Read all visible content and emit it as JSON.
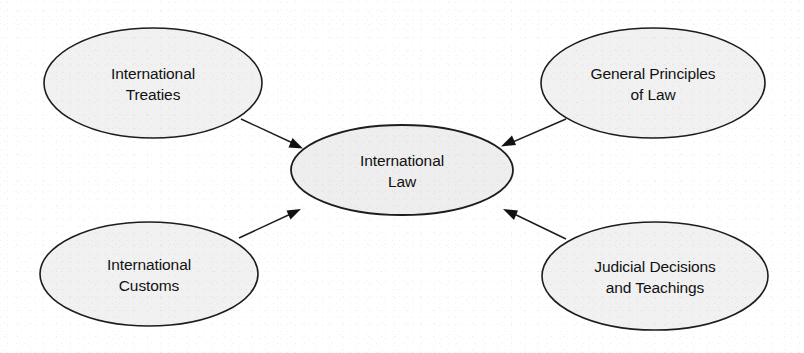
{
  "diagram": {
    "type": "hub-and-spoke concept map",
    "background_color": "#ffffff",
    "node_fill_color": "#f1f1f1",
    "node_stroke_color": "#1d1d1d",
    "arrow_color": "#111111",
    "center_node": {
      "id": "international-law",
      "label": "International\nLaw",
      "cx": 402,
      "cy": 170,
      "rx": 111,
      "ry": 45
    },
    "source_nodes": [
      {
        "id": "international-treaties",
        "label": "International\nTreaties",
        "cx": 153,
        "cy": 83,
        "rx": 109,
        "ry": 55,
        "position": "top-left"
      },
      {
        "id": "general-principles-of-law",
        "label": "General Principles\nof Law",
        "cx": 653,
        "cy": 83,
        "rx": 112,
        "ry": 55,
        "position": "top-right"
      },
      {
        "id": "international-customs",
        "label": "International\nCustoms",
        "cx": 149,
        "cy": 274,
        "rx": 109,
        "ry": 52,
        "position": "bottom-left"
      },
      {
        "id": "judicial-decisions-and-teachings",
        "label": "Judicial Decisions\nand Teachings",
        "cx": 655,
        "cy": 276,
        "rx": 113,
        "ry": 54,
        "position": "bottom-right"
      }
    ],
    "edges": [
      {
        "id": "edge-treaties-to-law",
        "from": "international-treaties",
        "to": "international-law",
        "direction": "inward",
        "x1": 241,
        "y1": 119,
        "x2": 301,
        "y2": 148
      },
      {
        "id": "edge-principles-to-law",
        "from": "general-principles-of-law",
        "to": "international-law",
        "direction": "inward",
        "x1": 566,
        "y1": 119,
        "x2": 503,
        "y2": 146
      },
      {
        "id": "edge-customs-to-law",
        "from": "international-customs",
        "to": "international-law",
        "direction": "inward",
        "x1": 239,
        "y1": 238,
        "x2": 299,
        "y2": 209
      },
      {
        "id": "edge-judicial-to-law",
        "from": "judicial-decisions-and-teachings",
        "to": "international-law",
        "direction": "inward",
        "x1": 566,
        "y1": 239,
        "x2": 504,
        "y2": 209
      }
    ]
  }
}
